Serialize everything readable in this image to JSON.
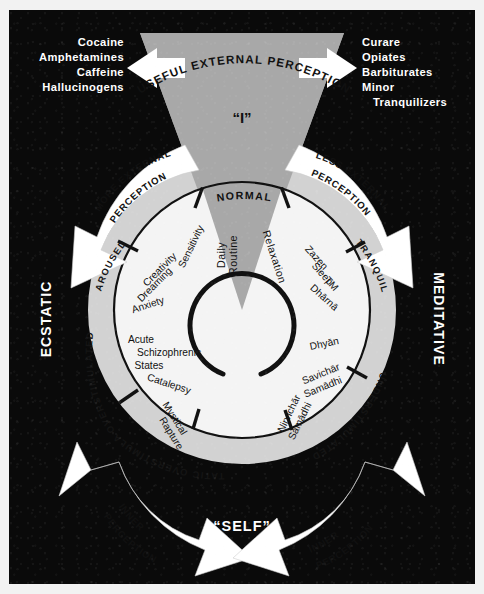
{
  "diagram": {
    "background_color": "#0a0a0a",
    "wedge_color": "#a8a8a8",
    "band_color": "#d2d2d2",
    "disc_color": "#f4f4f4",
    "arrow_color": "#ffffff"
  },
  "top": {
    "arc_label": "USEFUL EXTERNAL PERCEPTION",
    "center_label": "“I”"
  },
  "bottom": {
    "center_label": "“SELF”"
  },
  "drugs_left": {
    "items": [
      "Cocaine",
      "Amphetamines",
      "Caffeine",
      "Hallucinogens"
    ]
  },
  "drugs_right": {
    "items": [
      "Curare",
      "Opiates",
      "Barbiturates",
      "Minor",
      "Tranquilizers"
    ]
  },
  "arrows": {
    "top_left": {
      "label_line1": "MORE EXTERNAL",
      "label_line2": "PERCEPTION"
    },
    "top_right": {
      "label_line1": "LESS EXTERNAL",
      "label_line2": "PERCEPTION"
    },
    "bottom_left": {
      "label_line1": "INNER",
      "label_line2": "PERCEPTION"
    },
    "bottom_right": {
      "label_line1": "INNER",
      "label_line2": "PERCEPTION"
    }
  },
  "side_labels": {
    "left": "ECSTATIC",
    "right": "MEDITATIVE"
  },
  "ring_bands": {
    "aroused": "AROUSED",
    "overstimulated": "OVERSTIMULATED",
    "ecstatic_overstimulated": "ECSTATIC OVERSTIMULATED",
    "tranquil": "TRANQUIL",
    "understimulated": "UNDERSTIMULATED",
    "normal": "NORMAL"
  },
  "sectors": {
    "normal": {
      "band": "NORMAL",
      "entries": [
        "Daily Routine",
        "Relaxation"
      ]
    },
    "aroused": {
      "band": "AROUSED",
      "entries": [
        "Sensitivity",
        "Creativity",
        "Dreaming",
        "Anxiety"
      ]
    },
    "overstimulated": {
      "band": "OVERSTIMULATED",
      "entries": [
        "Acute Schizophrenic States",
        "Catalepsy",
        "Mystical Rapture"
      ]
    },
    "tranquil": {
      "band": "TRANQUIL",
      "entries": [
        "Zazen",
        "Sleep",
        "TM",
        "Dhārnā"
      ]
    },
    "understimulated": {
      "band": "UNDERSTIMULATED",
      "entries": [
        "Dhyān",
        "Savichār Samādhi",
        "Nirvichār Samādhi"
      ]
    }
  },
  "ring_items": {
    "sensitivity": "Sensitivity",
    "creativity": "Creativity",
    "dreaming": "Dreaming",
    "anxiety": "Anxiety",
    "acute_line1": "Acute",
    "acute_line2": "Schizophrenic",
    "acute_line3": "States",
    "catalepsy": "Catalepsy",
    "mystical1": "Mystical",
    "mystical2": "Rapture",
    "daily1": "Daily",
    "daily2": "Routine",
    "relaxation": "Relaxation",
    "zazen": "Zazen",
    "sleep": "Sleep",
    "tm": "TM",
    "dharna": "Dhārnā",
    "dhyan": "Dhyān",
    "savichar1": "Savichār",
    "savichar2": "Samādhi",
    "nirvichar1": "Nirvichār",
    "nirvichar2": "Samādhi"
  }
}
